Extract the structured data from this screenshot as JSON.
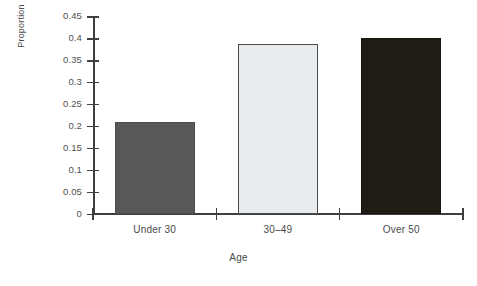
{
  "chart_data": {
    "type": "bar",
    "title": "",
    "xlabel": "Age",
    "ylabel": "Proportion",
    "categories": [
      "Under 30",
      "30–49",
      "Over 50"
    ],
    "values": [
      0.21,
      0.388,
      0.402
    ],
    "ylim": [
      0,
      0.45
    ],
    "yticks": [
      0,
      0.05,
      0.1,
      0.15,
      0.2,
      0.25,
      0.3,
      0.35,
      0.4,
      0.45
    ],
    "ytick_labels": [
      "0",
      "0.05",
      "0.1",
      "0.15",
      "0.2",
      "0.25",
      "0.3",
      "0.35",
      "0.4",
      "0.45"
    ],
    "grid": false,
    "legend": false,
    "bar_colors": [
      "#585858",
      "#e8ecee",
      "#1e1c14"
    ],
    "series": [
      {
        "name": "Proportion",
        "values": [
          0.21,
          0.388,
          0.402
        ]
      }
    ]
  },
  "axes": {
    "y_title": "Proportion",
    "x_title": "Age"
  }
}
